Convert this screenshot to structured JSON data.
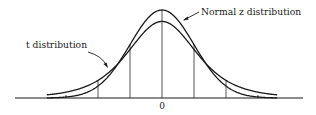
{
  "diagram": {
    "type": "overlaid probability density curves",
    "labels": {
      "normal": "Normal z distribution",
      "t": "t distribution",
      "center_tick": "0"
    },
    "curves": [
      {
        "name": "Normal z distribution",
        "family": "normal",
        "sd": 1.0,
        "relative_peak": 1.0
      },
      {
        "name": "t distribution",
        "family": "t",
        "relative_peak": 0.87
      }
    ],
    "x_range_sd": [
      -3.6,
      3.6
    ],
    "ordinates_at_sd": [
      -2,
      -1,
      0,
      1,
      2
    ],
    "colors": {
      "ink": "#1a1a1a",
      "background": "#ffffff"
    }
  }
}
